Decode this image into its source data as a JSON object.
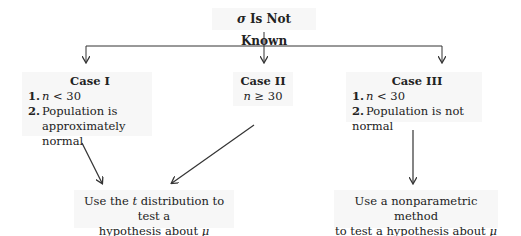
{
  "root": {
    "symbol": "σ",
    "label": "Is Not Known"
  },
  "cases": [
    {
      "title": "Case I",
      "items": [
        {
          "num": "1.",
          "var": "n",
          "text": " < 30"
        },
        {
          "num": "2.",
          "text": "Population is",
          "text2": "approximately normal"
        }
      ]
    },
    {
      "title": "Case II",
      "var": "n",
      "text": " ≥ 30"
    },
    {
      "title": "Case III",
      "items": [
        {
          "num": "1.",
          "var": "n",
          "text": " < 30"
        },
        {
          "num": "2.",
          "text": "Population is not normal"
        }
      ]
    }
  ],
  "outcomes": [
    {
      "line1_a": "Use the ",
      "line1_var": "t",
      "line1_b": " distribution to test a",
      "line2": "hypothesis about ",
      "line2_var": "μ"
    },
    {
      "line1": "Use a nonparametric method",
      "line2": "to test a hypothesis about ",
      "line2_var": "μ"
    }
  ],
  "colors": {
    "line": "#333333",
    "box_bg": "#f7f7f7"
  }
}
